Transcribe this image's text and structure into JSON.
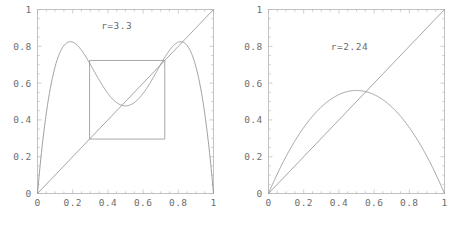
{
  "figure": {
    "background_color": "#ffffff",
    "curve_color": "#8f8f8f",
    "frame_color": "#b3b3b3",
    "label_color": "#6a6a6a"
  },
  "chart_data": [
    {
      "type": "line",
      "panel": "left",
      "title": "",
      "annotation": "r=3.3",
      "annotation_x": 0.45,
      "annotation_y": 0.895,
      "xlabel": "",
      "ylabel": "",
      "xlim": [
        0,
        1
      ],
      "ylim": [
        0,
        1
      ],
      "grid": false,
      "legend": "none",
      "xticks": [
        0,
        0.2,
        0.4,
        0.6,
        0.8,
        1
      ],
      "xticklabels": [
        "0",
        "0.2",
        "0.4",
        "0.6",
        "0.8",
        "1"
      ],
      "yticks": [
        0,
        0.2,
        0.4,
        0.6,
        0.8,
        1
      ],
      "yticklabels": [
        "0",
        "0.2",
        "0.4",
        "0.6",
        "0.8",
        "1"
      ],
      "series": [
        {
          "name": "second-iterate",
          "function": "f2(x) = r*(r*x*(1-x))*(1-r*x*(1-x))",
          "r": 3.3,
          "x": [
            0,
            0.025,
            0.05,
            0.075,
            0.1,
            0.125,
            0.15,
            0.175,
            0.2,
            0.225,
            0.25,
            0.275,
            0.3,
            0.325,
            0.35,
            0.375,
            0.4,
            0.425,
            0.45,
            0.475,
            0.5,
            0.525,
            0.55,
            0.575,
            0.6,
            0.625,
            0.65,
            0.675,
            0.7,
            0.725,
            0.75,
            0.775,
            0.8,
            0.825,
            0.85,
            0.875,
            0.9,
            0.925,
            0.95,
            0.975,
            1
          ],
          "values": [
            0,
            0.242,
            0.436,
            0.589,
            0.706,
            0.79,
            0.806,
            0.82,
            0.812,
            0.79,
            0.757,
            0.718,
            0.675,
            0.631,
            0.589,
            0.551,
            0.519,
            0.495,
            0.48,
            0.474,
            0.477,
            0.487,
            0.5,
            0.521,
            0.551,
            0.589,
            0.631,
            0.675,
            0.718,
            0.757,
            0.79,
            0.812,
            0.82,
            0.817,
            0.79,
            0.734,
            0.64,
            0.503,
            0.329,
            0.142,
            0
          ]
        },
        {
          "name": "identity-diagonal",
          "function": "y = x",
          "x": [
            0,
            1
          ],
          "values": [
            0,
            1
          ]
        },
        {
          "name": "cobweb-square",
          "description": "square connecting the two points of the period-2 cycle",
          "points_x": [
            0.2959,
            0.2959,
            0.7231,
            0.7231,
            0.2959
          ],
          "points_y": [
            0.2959,
            0.7231,
            0.7231,
            0.2959,
            0.2959
          ]
        }
      ]
    },
    {
      "type": "line",
      "panel": "right",
      "title": "",
      "annotation": "r=2.24",
      "annotation_x": 0.46,
      "annotation_y": 0.78,
      "xlabel": "",
      "ylabel": "",
      "xlim": [
        0,
        1
      ],
      "ylim": [
        0,
        1
      ],
      "grid": false,
      "legend": "none",
      "xticks": [
        0,
        0.2,
        0.4,
        0.6,
        0.8,
        1
      ],
      "xticklabels": [
        "0",
        "0.2",
        "0.4",
        "0.6",
        "0.8",
        "1"
      ],
      "yticks": [
        0,
        0.2,
        0.4,
        0.6,
        0.8,
        1
      ],
      "yticklabels": [
        "0",
        "0.2",
        "0.4",
        "0.6",
        "0.8",
        "1"
      ],
      "series": [
        {
          "name": "logistic-map",
          "function": "f(x) = r*x*(1-x)",
          "r": 2.24,
          "x": [
            0,
            0.05,
            0.1,
            0.15,
            0.2,
            0.25,
            0.3,
            0.35,
            0.4,
            0.45,
            0.5,
            0.55,
            0.6,
            0.65,
            0.7,
            0.75,
            0.8,
            0.85,
            0.9,
            0.95,
            1
          ],
          "values": [
            0,
            0.106,
            0.202,
            0.286,
            0.358,
            0.42,
            0.47,
            0.51,
            0.538,
            0.554,
            0.56,
            0.554,
            0.538,
            0.51,
            0.47,
            0.42,
            0.358,
            0.286,
            0.202,
            0.106,
            0
          ]
        },
        {
          "name": "identity-diagonal",
          "function": "y = x",
          "x": [
            0,
            1
          ],
          "values": [
            0,
            1
          ]
        }
      ]
    }
  ]
}
